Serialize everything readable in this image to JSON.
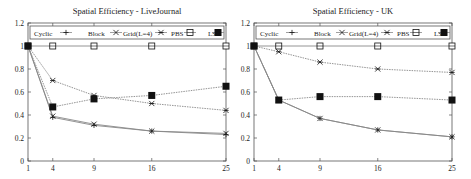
{
  "chart_data": [
    {
      "type": "line",
      "title": "Spatial Efficiency - LiveJournal",
      "xlabel": "",
      "ylabel": "",
      "x": [
        1,
        4,
        9,
        16,
        25
      ],
      "xticks": [
        "1",
        "4",
        "9",
        "16",
        "25"
      ],
      "yticks": [
        "0",
        "0.2",
        "0.4",
        "0.6",
        "0.8",
        "1",
        "1.2"
      ],
      "ylim": [
        0,
        1.2
      ],
      "grid": false,
      "legend_position": "top-inside",
      "series": [
        {
          "name": "Cyclic",
          "marker": "plus",
          "values": [
            1.0,
            0.38,
            0.31,
            0.26,
            0.23
          ]
        },
        {
          "name": "Block",
          "marker": "x",
          "values": [
            1.0,
            0.39,
            0.32,
            0.26,
            0.24
          ]
        },
        {
          "name": "Grid(L=4)",
          "marker": "asterisk",
          "values": [
            1.0,
            0.7,
            0.57,
            0.5,
            0.44
          ]
        },
        {
          "name": "PBS",
          "marker": "square-open",
          "values": [
            1.0,
            1.0,
            1.0,
            1.0,
            1.0
          ]
        },
        {
          "name": "LS",
          "marker": "square-filled",
          "values": [
            1.0,
            0.47,
            0.54,
            0.57,
            0.65
          ]
        }
      ]
    },
    {
      "type": "line",
      "title": "Spatial Efficiency - UK",
      "xlabel": "",
      "ylabel": "",
      "x": [
        1,
        4,
        9,
        16,
        25
      ],
      "xticks": [
        "1",
        "4",
        "9",
        "16",
        "25"
      ],
      "yticks": [
        "0",
        "0.2",
        "0.4",
        "0.6",
        "0.8",
        "1",
        "1.2"
      ],
      "ylim": [
        0,
        1.2
      ],
      "grid": false,
      "legend_position": "top-inside",
      "series": [
        {
          "name": "Cyclic",
          "marker": "plus",
          "values": [
            1.0,
            0.53,
            0.37,
            0.27,
            0.21
          ]
        },
        {
          "name": "Block",
          "marker": "x",
          "values": [
            1.0,
            0.53,
            0.37,
            0.27,
            0.21
          ]
        },
        {
          "name": "Grid(L=4)",
          "marker": "asterisk",
          "values": [
            1.0,
            0.95,
            0.86,
            0.8,
            0.77
          ]
        },
        {
          "name": "PBS",
          "marker": "square-open",
          "values": [
            1.0,
            1.0,
            1.0,
            1.0,
            1.0
          ]
        },
        {
          "name": "LS",
          "marker": "square-filled",
          "values": [
            1.0,
            0.53,
            0.56,
            0.56,
            0.53
          ]
        }
      ]
    }
  ],
  "legend_labels": [
    "Cyclic",
    "Block",
    "Grid(L=4)",
    "PBS",
    "LS"
  ],
  "colors": {
    "axis": "#555555",
    "line": "#888888",
    "marker": "#111111"
  }
}
